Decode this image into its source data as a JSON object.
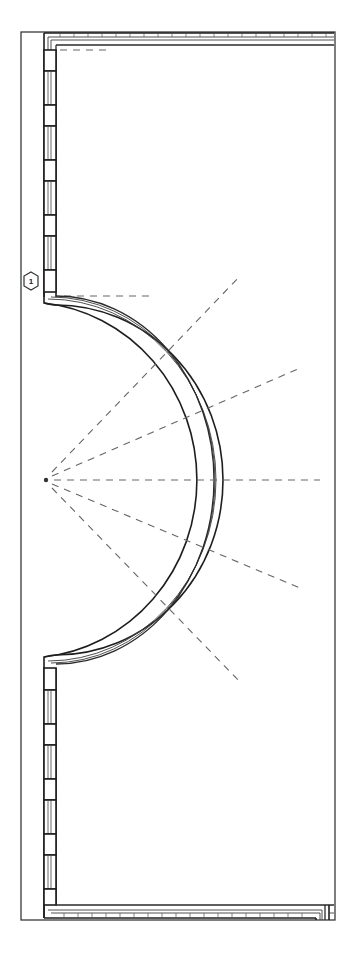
{
  "drawing": {
    "type": "architectural-floor-plan",
    "description": "Plan of a rectangular room with a semicircular bay projecting from the left wall, window bays along the left wall, and dashed radial reference lines from the arc center",
    "tag": {
      "label": "1",
      "shape": "hexagon"
    },
    "colors": {
      "background": "#ffffff",
      "line": "#1e1e1e",
      "dashed": "#666666"
    },
    "elements": {
      "outer_frame": "thin rectangle boundary",
      "walls": "multi-line wall (top, left, bottom) with right side frame",
      "curved_bay": "semicircular wall segment",
      "windows_upper_count": 8,
      "windows_lower_count": 8,
      "radial_dashed_lines": 6
    }
  }
}
